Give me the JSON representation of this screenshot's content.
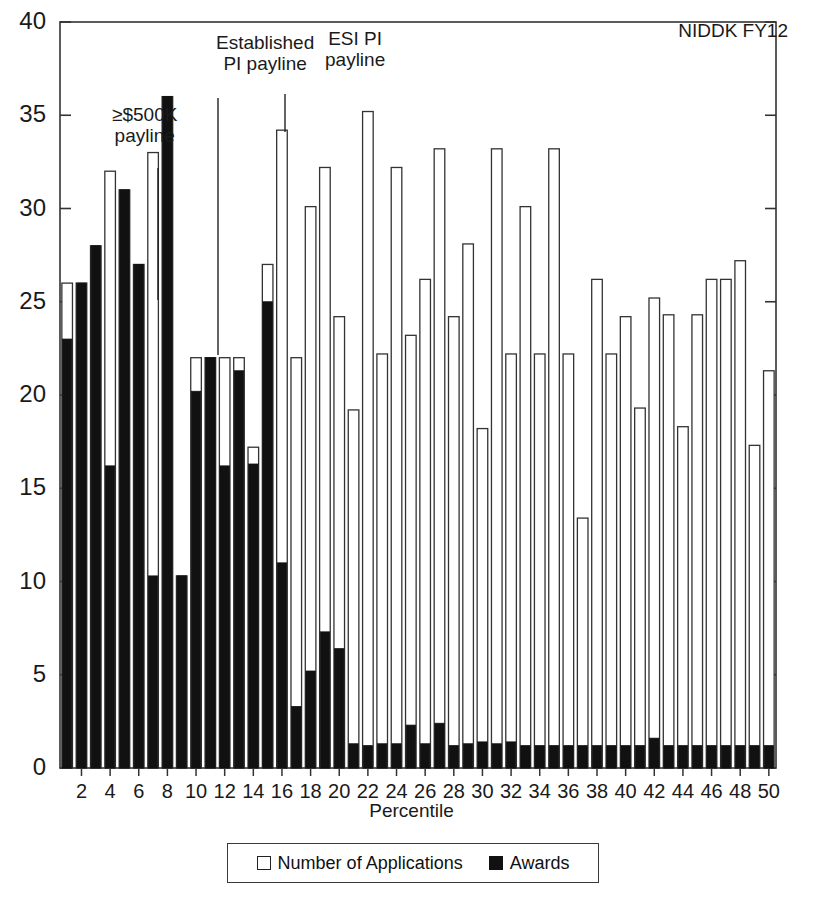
{
  "corner_label": "NIDDK FY12",
  "legend": {
    "items": [
      {
        "key": "applications",
        "label": "Number of Applications",
        "style": "open",
        "color": "#ffffff"
      },
      {
        "key": "awards",
        "label": "Awards",
        "style": "filled",
        "color": "#111111"
      }
    ]
  },
  "annotations": [
    {
      "name": "500k-payline",
      "text": "≥$500K\npayline",
      "x": 112,
      "y": 104,
      "line_x": 158,
      "line_y1": 168,
      "line_y2": 300
    },
    {
      "name": "established-pi-payline",
      "text": "Established\nPI payline",
      "x": 216,
      "y": 32,
      "line_x": 218,
      "line_y1": 98,
      "line_y2": 355
    },
    {
      "name": "esi-pi-payline",
      "text": "ESI PI\npayline",
      "x": 325,
      "y": 28,
      "line_x": 285,
      "line_y1": 94,
      "line_y2": 132
    }
  ],
  "chart_data": {
    "type": "bar",
    "subtype": "overlaid-stacked",
    "title": "NIDDK FY12",
    "xlabel": "Percentile",
    "ylabel": "",
    "xlim": [
      0.5,
      50.5
    ],
    "ylim": [
      0,
      40
    ],
    "yticks": [
      0,
      5,
      10,
      15,
      20,
      25,
      30,
      35,
      40
    ],
    "xticks": [
      2,
      4,
      6,
      8,
      10,
      12,
      14,
      16,
      18,
      20,
      22,
      24,
      26,
      28,
      30,
      32,
      34,
      36,
      38,
      40,
      42,
      44,
      46,
      48,
      50
    ],
    "grid": false,
    "legend_position": "bottom",
    "categories": [
      1,
      2,
      3,
      4,
      5,
      6,
      7,
      8,
      9,
      10,
      11,
      12,
      13,
      14,
      15,
      16,
      17,
      18,
      19,
      20,
      21,
      22,
      23,
      24,
      25,
      26,
      27,
      28,
      29,
      30,
      31,
      32,
      33,
      34,
      35,
      36,
      37,
      38,
      39,
      40,
      41,
      42,
      43,
      44,
      45,
      46,
      47,
      48,
      49,
      50
    ],
    "series": [
      {
        "name": "Number of Applications",
        "values": [
          26,
          26,
          28,
          32,
          31,
          27,
          33,
          36,
          10.3,
          22,
          22,
          22,
          22,
          17.2,
          27,
          34.2,
          22,
          30.1,
          32.2,
          24.2,
          19.2,
          35.2,
          22.2,
          32.2,
          23.2,
          26.2,
          33.2,
          24.2,
          28.1,
          18.2,
          33.2,
          22.2,
          30.1,
          22.2,
          33.2,
          22.2,
          13.4,
          26.2,
          22.2,
          24.2,
          19.3,
          25.2,
          24.3,
          18.3,
          24.3,
          26.2,
          26.2,
          27.2,
          17.3,
          21.3
        ]
      },
      {
        "name": "Awards",
        "values": [
          23,
          26,
          28,
          16.2,
          31,
          27,
          10.3,
          36,
          10.3,
          20.2,
          22,
          16.2,
          21.3,
          16.3,
          25,
          11,
          3.3,
          5.2,
          7.3,
          6.4,
          1.3,
          1.2,
          1.3,
          1.3,
          2.3,
          1.3,
          2.4,
          1.2,
          1.3,
          1.4,
          1.3,
          1.4,
          1.2,
          1.2,
          1.2,
          1.2,
          1.2,
          1.2,
          1.2,
          1.2,
          1.2,
          1.6,
          1.2,
          1.2,
          1.2,
          1.2,
          1.2,
          1.2,
          1.2,
          1.2
        ]
      }
    ]
  }
}
